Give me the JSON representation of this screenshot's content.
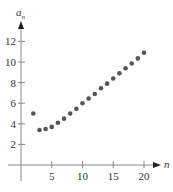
{
  "chart_data": {
    "type": "scatter",
    "title": "",
    "xlabel": "n",
    "ylabel": "a_n",
    "ylabel_main": "a",
    "ylabel_sub": "n",
    "xlim": [
      0,
      22
    ],
    "ylim": [
      0,
      13.5
    ],
    "xticks": [
      5,
      10,
      15,
      20
    ],
    "xtick_labels": [
      "5",
      "10",
      "15",
      "20"
    ],
    "yticks": [
      2,
      4,
      6,
      8,
      10,
      12
    ],
    "ytick_labels": [
      "2",
      "4",
      "6",
      "8",
      "10",
      "12"
    ],
    "grid": false,
    "legend": null,
    "x": [
      2,
      3,
      4,
      5,
      6,
      7,
      8,
      9,
      10,
      11,
      12,
      13,
      14,
      15,
      16,
      17,
      18,
      19,
      20
    ],
    "y": [
      5.0,
      3.4,
      3.5,
      3.7,
      4.1,
      4.5,
      5.0,
      5.45,
      6.0,
      6.45,
      6.9,
      7.45,
      7.9,
      8.4,
      8.9,
      9.4,
      9.85,
      10.35,
      10.9
    ],
    "point_color": "#555555",
    "axis_color": "#888888"
  }
}
